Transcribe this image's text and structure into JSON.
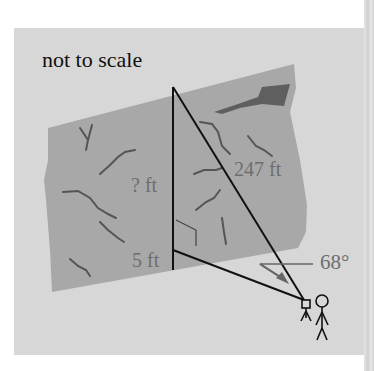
{
  "diagram": {
    "title": "not to scale",
    "labels": {
      "unknown_height": "? ft",
      "hypotenuse": "247 ft",
      "instrument_height": "5 ft",
      "angle": "68°"
    },
    "icons": {
      "camera": "surveying-instrument-icon",
      "person": "stick-figure-icon"
    },
    "colors": {
      "background": "#d7d7d7",
      "rock": "#a7a7a7",
      "rock_dark": "#5f5f5f",
      "crack": "#555555",
      "line": "#111111",
      "label": "#6e6e6e"
    }
  }
}
